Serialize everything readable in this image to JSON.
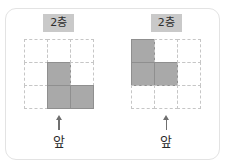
{
  "figure": {
    "title": "",
    "background_color": "#ffffff",
    "frame_color": "#e3e3e3",
    "filled_cell_color": "#a9a9a9",
    "grid_line_color": "#c6c6c6",
    "label_chip_color": "#c9c9c9"
  },
  "panels": [
    {
      "id": "left-panel",
      "floor_label": "2층",
      "front_label": "앞",
      "arrow_icon": "arrow-up-icon",
      "grid": {
        "rows": 3,
        "cols": 3,
        "cells": [
          [
            0,
            0,
            0
          ],
          [
            0,
            1,
            0
          ],
          [
            0,
            1,
            1
          ]
        ]
      }
    },
    {
      "id": "right-panel",
      "floor_label": "2층",
      "front_label": "앞",
      "arrow_icon": "arrow-up-icon",
      "grid": {
        "rows": 3,
        "cols": 3,
        "cells": [
          [
            1,
            0,
            0
          ],
          [
            1,
            1,
            0
          ],
          [
            0,
            0,
            0
          ]
        ]
      }
    }
  ]
}
